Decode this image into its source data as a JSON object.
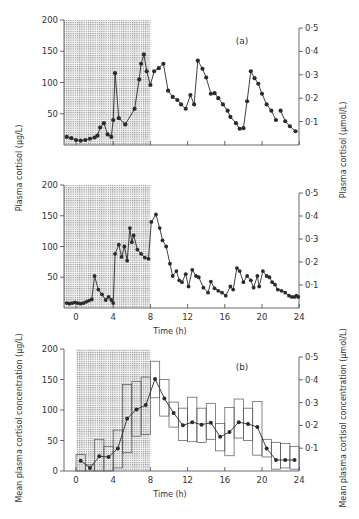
{
  "chart_data": [
    {
      "id": "a-top",
      "type": "line",
      "panel_label": "(a)",
      "ylabel_left": "Plasma cortisol (µg/L)",
      "ylabel_right": "Plasma cortisol (µmol/L)",
      "xlabel": "",
      "xlim": [
        -1.3,
        24
      ],
      "ylim": [
        0,
        200
      ],
      "yticks_left": [
        50,
        100,
        150,
        200
      ],
      "yticks_right": [
        "0·1",
        "0·2",
        "0·3",
        "0·4",
        "0·5"
      ],
      "shaded_region": {
        "x": [
          -1.3,
          8
        ],
        "label": "night / sleep period"
      },
      "series": [
        {
          "name": "subject 1",
          "x": [
            -1.0,
            -0.5,
            0.0,
            0.5,
            1.0,
            1.5,
            2.0,
            2.3,
            2.6,
            3.0,
            3.4,
            3.8,
            4.0,
            4.2,
            4.6,
            5.3,
            6.3,
            6.8,
            7.0,
            7.3,
            7.6,
            8.0,
            8.4,
            8.9,
            9.4,
            9.9,
            10.4,
            10.9,
            11.3,
            11.8,
            12.3,
            12.7,
            13.1,
            13.6,
            14.0,
            14.5,
            14.9,
            15.3,
            15.8,
            16.3,
            16.6,
            17.2,
            17.6,
            18.0,
            18.4,
            18.8,
            19.2,
            19.6,
            20.0,
            20.5,
            21.0,
            21.5,
            22.0,
            22.5,
            23.0,
            23.5,
            24.0
          ],
          "y": [
            13,
            11,
            8,
            7,
            8,
            10,
            12,
            15,
            28,
            35,
            17,
            13,
            40,
            115,
            43,
            33,
            58,
            105,
            130,
            145,
            118,
            96,
            118,
            123,
            130,
            87,
            77,
            72,
            65,
            58,
            80,
            65,
            135,
            122,
            108,
            82,
            83,
            75,
            65,
            55,
            45,
            35,
            26,
            27,
            70,
            118,
            107,
            98,
            82,
            65,
            55,
            40,
            30,
            22,
            15,
            55,
            20
          ]
        },
        {
          "name": "subject 1 (tail)",
          "x": [
            22.0,
            22.5,
            23.0,
            23.6
          ],
          "y": [
            55,
            38,
            30,
            22
          ]
        }
      ]
    },
    {
      "id": "a-middle",
      "type": "line",
      "ylabel_left": "Plasma cortisol (µg/L)",
      "ylabel_right": "Plasma cortisol (µmol/L)",
      "xlabel": "Time (h)",
      "xticks": [
        0,
        4,
        8,
        12,
        16,
        20,
        24
      ],
      "xlim": [
        -1.3,
        24
      ],
      "ylim": [
        0,
        200
      ],
      "yticks_left": [
        50,
        100,
        150,
        200
      ],
      "yticks_right": [
        "0·1",
        "0·2",
        "0·3",
        "0·4",
        "0·5"
      ],
      "shaded_region": {
        "x": [
          -1.3,
          8
        ]
      },
      "series": [
        {
          "name": "subject 2",
          "x": [
            -1.0,
            -0.7,
            -0.4,
            -0.1,
            0.2,
            0.5,
            0.8,
            1.1,
            1.4,
            1.7,
            2.0,
            2.4,
            2.8,
            3.2,
            3.5,
            3.8,
            4.0,
            4.2,
            4.6,
            4.9,
            5.2,
            5.5,
            5.8,
            6.0,
            6.2,
            6.6,
            7.0,
            7.4,
            7.8,
            8.1,
            8.6,
            9.0,
            9.3,
            9.7,
            10.1,
            10.4,
            10.8,
            11.1,
            11.4,
            11.8,
            12.1,
            12.5,
            12.9,
            13.2,
            13.7,
            14.2,
            14.5,
            14.9,
            15.3,
            15.7,
            16.1,
            16.6,
            16.9,
            17.3,
            17.6,
            18.0,
            18.4,
            18.8,
            19.1,
            19.5,
            19.7,
            20.1,
            20.5,
            20.8,
            21.1,
            21.4,
            21.7,
            22.1,
            22.5,
            22.9,
            23.2,
            23.5,
            23.7,
            23.9
          ],
          "y": [
            8,
            7,
            8,
            9,
            8,
            7,
            8,
            10,
            12,
            14,
            52,
            30,
            22,
            13,
            18,
            13,
            8,
            88,
            103,
            83,
            100,
            77,
            130,
            107,
            118,
            95,
            88,
            82,
            80,
            140,
            152,
            130,
            110,
            100,
            72,
            52,
            60,
            45,
            42,
            55,
            35,
            62,
            52,
            50,
            33,
            25,
            43,
            32,
            28,
            25,
            20,
            35,
            30,
            65,
            60,
            42,
            52,
            45,
            33,
            52,
            35,
            60,
            52,
            50,
            42,
            38,
            30,
            28,
            25,
            20,
            18,
            18,
            20,
            18
          ]
        }
      ]
    },
    {
      "id": "b-bottom",
      "type": "line+boxes",
      "panel_label": "(b)",
      "ylabel_left": "Mean plasma cortisol concentration (µg/L)",
      "ylabel_right": "Mean plasma cortisol concentration (µmol/L)",
      "xlabel": "Time (h)",
      "xticks": [
        0,
        4,
        8,
        12,
        16,
        20,
        24
      ],
      "xlim": [
        -1.3,
        24
      ],
      "ylim": [
        0,
        200
      ],
      "yticks_left": [
        0,
        50,
        100,
        150,
        200
      ],
      "yticks_right": [
        "0·1",
        "0·2",
        "0·3",
        "0·4",
        "0·5"
      ],
      "shaded_region": {
        "x": [
          0,
          8
        ]
      },
      "mean_series": {
        "x": [
          0.5,
          1.5,
          2.5,
          3.5,
          4.5,
          5.5,
          6.5,
          7.5,
          8.5,
          9.5,
          10.5,
          11.5,
          12.5,
          13.5,
          14.5,
          15.5,
          16.5,
          17.5,
          18.5,
          19.5,
          20.5,
          21.5,
          22.5,
          23.5
        ],
        "y": [
          17,
          5,
          24,
          23,
          37,
          86,
          101,
          108,
          151,
          119,
          95,
          75,
          80,
          76,
          79,
          56,
          64,
          80,
          77,
          72,
          37,
          18,
          18,
          18
        ]
      },
      "boxes": [
        {
          "x0": 0,
          "x1": 1,
          "low": 0,
          "high": 27
        },
        {
          "x0": 1,
          "x1": 2,
          "low": 0,
          "high": 10
        },
        {
          "x0": 2,
          "x1": 3,
          "low": 0,
          "high": 52
        },
        {
          "x0": 3,
          "x1": 4,
          "low": 0,
          "high": 40
        },
        {
          "x0": 4,
          "x1": 5,
          "low": 5,
          "high": 67
        },
        {
          "x0": 5,
          "x1": 6,
          "low": 30,
          "high": 142
        },
        {
          "x0": 6,
          "x1": 7,
          "low": 57,
          "high": 147
        },
        {
          "x0": 7,
          "x1": 8,
          "low": 60,
          "high": 154
        },
        {
          "x0": 8,
          "x1": 9,
          "low": 120,
          "high": 180
        },
        {
          "x0": 9,
          "x1": 10,
          "low": 90,
          "high": 150
        },
        {
          "x0": 10,
          "x1": 11,
          "low": 72,
          "high": 113
        },
        {
          "x0": 11,
          "x1": 12,
          "low": 50,
          "high": 103
        },
        {
          "x0": 12,
          "x1": 13,
          "low": 48,
          "high": 121
        },
        {
          "x0": 13,
          "x1": 14,
          "low": 47,
          "high": 103
        },
        {
          "x0": 14,
          "x1": 15,
          "low": 52,
          "high": 111
        },
        {
          "x0": 15,
          "x1": 16,
          "low": 33,
          "high": 78
        },
        {
          "x0": 16,
          "x1": 17,
          "low": 25,
          "high": 104
        },
        {
          "x0": 17,
          "x1": 18,
          "low": 54,
          "high": 118
        },
        {
          "x0": 18,
          "x1": 19,
          "low": 50,
          "high": 103
        },
        {
          "x0": 19,
          "x1": 20,
          "low": 26,
          "high": 114
        },
        {
          "x0": 20,
          "x1": 21,
          "low": 23,
          "high": 52
        },
        {
          "x0": 21,
          "x1": 22,
          "low": 3,
          "high": 47
        },
        {
          "x0": 22,
          "x1": 23,
          "low": 5,
          "high": 45
        },
        {
          "x0": 23,
          "x1": 24,
          "low": 3,
          "high": 40
        }
      ]
    }
  ],
  "labels": {
    "panel_a": "(a)",
    "panel_b": "(b)",
    "x_axis": "Time (h)",
    "y_left_top": "Plasma cortisol (µg/L)",
    "y_right_top": "Plasma cortisol (µmol/L)",
    "y_left_bottom": "Mean plasma cortisol concentration (µg/L)",
    "y_right_bottom": "Mean plasma cortisol concentration (µmol/L)"
  },
  "style": {
    "ink": "#2b2b2b",
    "shade": "#9a9a9a",
    "axis": "#444444"
  }
}
